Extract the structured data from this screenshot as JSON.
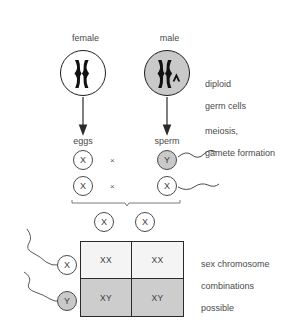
{
  "diagram": {
    "parents": [
      {
        "id": "female",
        "label": "female",
        "genotype": "(XX)",
        "cell_fill": "#ffffff",
        "chromosomes": [
          "X",
          "X"
        ]
      },
      {
        "id": "male",
        "label": "male",
        "genotype": "(XY)",
        "cell_fill": "#c9c9c9",
        "chromosomes": [
          "X",
          "Y"
        ]
      }
    ],
    "annotations": {
      "diploid": "diploid\ngerm cells",
      "diploid_line1": "diploid",
      "diploid_line2": "germ cells",
      "meiosis_line1": "meiosis,",
      "meiosis_line2": "gamete formation",
      "combinations_line1": "sex chromosome",
      "combinations_line2": "combinations",
      "combinations_line3": "possible"
    },
    "gametes": {
      "egg_label": "eggs",
      "sperm_label": "sperm",
      "cross_symbol": "×",
      "pairs": [
        {
          "egg": "X",
          "sperm": "Y",
          "sperm_fill": "#c9c9c9"
        },
        {
          "egg": "X",
          "sperm": "X",
          "sperm_fill": "#ffffff"
        }
      ]
    },
    "punnett": {
      "column_headers": [
        "X",
        "X"
      ],
      "row_headers": [
        "X",
        "Y"
      ],
      "row_header_fills": [
        "#ffffff",
        "#c9c9c9"
      ],
      "cells": [
        [
          "XX",
          "XX"
        ],
        [
          "XY",
          "XY"
        ]
      ],
      "row_fills": [
        "#f4f4f4",
        "#cdcdcd"
      ]
    },
    "colors": {
      "background": "#ffffff",
      "stroke": "#1d1d1d",
      "text": "#4a4a4a",
      "gray_fill": "#c9c9c9",
      "light_cell": "#f4f4f4",
      "dark_cell": "#cdcdcd"
    }
  }
}
